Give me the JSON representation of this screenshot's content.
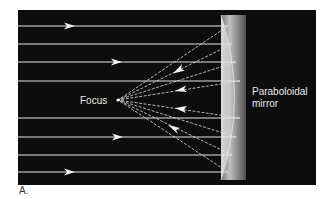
{
  "figure": {
    "panel_label": "A.",
    "focus_label": "Focus",
    "mirror_label_line1": "Paraboloidal",
    "mirror_label_line2": "mirror"
  },
  "colors": {
    "background": "#ffffff",
    "panel": "#0d0d0d",
    "ray": "#e6e6e6",
    "label": "#e8e8e8",
    "mirror_light": "#d9d9d9",
    "mirror_dark": "#6a6a6a"
  },
  "diagram": {
    "frame": {
      "x": 18,
      "y": 10,
      "width": 298,
      "height": 175
    },
    "focus_point": {
      "x": 118,
      "y": 100
    },
    "mirror": {
      "x": 221,
      "y": 15,
      "width": 25,
      "height": 165
    },
    "incoming_rays_y": [
      26,
      44,
      62,
      81,
      118,
      137,
      155,
      172
    ],
    "incoming_arrows": [
      {
        "x": 70,
        "y": 26
      },
      {
        "x": 117,
        "y": 62
      },
      {
        "x": 118,
        "y": 137
      },
      {
        "x": 70,
        "y": 172
      }
    ],
    "reflected_arrows": [
      {
        "x": 178,
        "y": 70
      },
      {
        "x": 182,
        "y": 90
      },
      {
        "x": 182,
        "y": 109
      },
      {
        "x": 175,
        "y": 129
      }
    ]
  }
}
